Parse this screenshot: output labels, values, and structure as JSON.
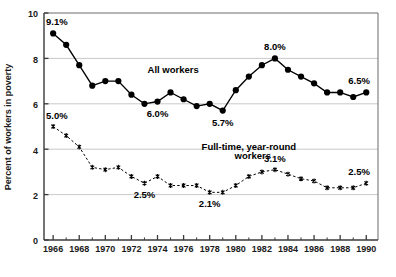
{
  "chart_data": {
    "type": "line",
    "title": "",
    "xlabel": "",
    "ylabel": "Percent of workers in poverty",
    "xlim": [
      1965.3,
      1990.9
    ],
    "ylim": [
      0,
      10
    ],
    "yticks": [
      0,
      2,
      4,
      6,
      8,
      10
    ],
    "ytick_labels": [
      "0",
      "2",
      "4",
      "6",
      "8",
      "10"
    ],
    "xticks": [
      1966,
      1968,
      1970,
      1972,
      1974,
      1976,
      1978,
      1980,
      1982,
      1984,
      1986,
      1988,
      1990
    ],
    "xtick_labels": [
      "1966",
      "1968",
      "1970",
      "1972",
      "1974",
      "1976",
      "1978",
      "1980",
      "1982",
      "1984",
      "1986",
      "1988",
      "1990"
    ],
    "grid": "horizontal-major",
    "legend": "inline-labels",
    "x": [
      1966,
      1967,
      1968,
      1969,
      1970,
      1971,
      1972,
      1973,
      1974,
      1975,
      1976,
      1977,
      1978,
      1979,
      1980,
      1981,
      1982,
      1983,
      1984,
      1985,
      1986,
      1987,
      1988,
      1989,
      1990
    ],
    "series": [
      {
        "name": "All workers",
        "marker": "filled-circle",
        "linestyle": "solid",
        "color": "#000000",
        "values": [
          9.1,
          8.6,
          7.7,
          6.8,
          7.0,
          7.0,
          6.4,
          6.0,
          6.1,
          6.5,
          6.2,
          5.9,
          6.0,
          5.7,
          6.6,
          7.2,
          7.7,
          8.0,
          7.5,
          7.2,
          6.9,
          6.5,
          6.5,
          6.3,
          6.5
        ]
      },
      {
        "name": "Full-time, year-round workers",
        "marker": "asterisk",
        "linestyle": "dashed",
        "color": "#000000",
        "values": [
          5.0,
          4.6,
          4.1,
          3.2,
          3.1,
          3.2,
          2.8,
          2.5,
          2.8,
          2.4,
          2.4,
          2.4,
          2.1,
          2.1,
          2.4,
          2.8,
          3.0,
          3.1,
          2.9,
          2.7,
          2.6,
          2.3,
          2.3,
          2.3,
          2.5
        ]
      }
    ],
    "annotations": [
      {
        "text": "9.1%",
        "x": 1966,
        "y": 9.1,
        "place": "above-left"
      },
      {
        "text": "6.0%",
        "x": 1974,
        "y": 6.1,
        "place": "below"
      },
      {
        "text": "5.7%",
        "x": 1979,
        "y": 5.7,
        "place": "below"
      },
      {
        "text": "8.0%",
        "x": 1983,
        "y": 8.0,
        "place": "above"
      },
      {
        "text": "6.5%",
        "x": 1990,
        "y": 6.5,
        "place": "above-left"
      },
      {
        "text": "5.0%",
        "x": 1966,
        "y": 5.0,
        "place": "above-left"
      },
      {
        "text": "2.5%",
        "x": 1973,
        "y": 2.5,
        "place": "below"
      },
      {
        "text": "2.1%",
        "x": 1978,
        "y": 2.1,
        "place": "below"
      },
      {
        "text": "3.1%",
        "x": 1983,
        "y": 3.1,
        "place": "above"
      },
      {
        "text": "2.5%",
        "x": 1990,
        "y": 2.5,
        "place": "above-left"
      }
    ],
    "series_labels": [
      {
        "text": "All workers",
        "x": 1975.2,
        "y": 7.35
      },
      {
        "text": "Full-time, year-round",
        "x": 1981.0,
        "y": 3.95
      },
      {
        "text": "workers",
        "x": 1981.3,
        "y": 3.55
      }
    ]
  },
  "ytick_texts": {
    "t0": "0",
    "t2": "2",
    "t4": "4",
    "t6": "6",
    "t8": "8",
    "t10": "10"
  },
  "xtick_texts": {
    "t1966": "1966",
    "t1968": "1968",
    "t1970": "1970",
    "t1972": "1972",
    "t1974": "1974",
    "t1976": "1976",
    "t1978": "1978",
    "t1980": "1980",
    "t1982": "1982",
    "t1984": "1984",
    "t1986": "1986",
    "t1988": "1988",
    "t1990": "1990"
  },
  "axis": {
    "y_title": "Percent of workers in poverty"
  },
  "annot_texts": {
    "a0": "9.1%",
    "a1": "6.0%",
    "a2": "5.7%",
    "a3": "8.0%",
    "a4": "6.5%",
    "a5": "5.0%",
    "a6": "2.5%",
    "a7": "2.1%",
    "a8": "3.1%",
    "a9": "2.5%"
  },
  "series_label_texts": {
    "s0": "All workers",
    "s1": "Full-time, year-round",
    "s2": "workers"
  },
  "colors": {
    "line": "#000000",
    "grid": "#c9c9c9",
    "frame": "#555555",
    "text": "#111111",
    "background": "#ffffff"
  }
}
